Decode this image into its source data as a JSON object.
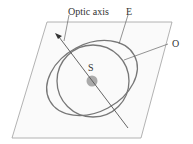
{
  "diagram": {
    "labels": {
      "optic_axis": "Optic axis",
      "extraordinary": "E",
      "ordinary": "O",
      "source": "S"
    },
    "colors": {
      "plane_edge": "#9a9a9a",
      "wavefront": "#777777",
      "axis_line": "#555555",
      "source_dot": "#aaaaaa",
      "label_text": "#333333"
    }
  }
}
